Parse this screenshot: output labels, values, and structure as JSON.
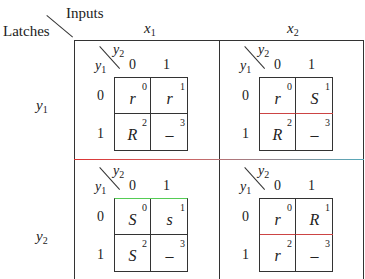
{
  "header": {
    "inputs_label": "Inputs",
    "latches_label": "Latches",
    "columns": [
      {
        "var": "x",
        "sub": "1"
      },
      {
        "var": "x",
        "sub": "2"
      }
    ],
    "rows": [
      {
        "var": "y",
        "sub": "1"
      },
      {
        "var": "y",
        "sub": "2"
      }
    ]
  },
  "kmap_labels": {
    "col_var": "y",
    "col_sub": "2",
    "row_var": "y",
    "row_sub": "1",
    "col_values": [
      "0",
      "1"
    ],
    "row_values": [
      "0",
      "1"
    ]
  },
  "maps": [
    {
      "id": "y1-x1",
      "cells": [
        {
          "v": "r",
          "n": "0"
        },
        {
          "v": "r",
          "n": "1"
        },
        {
          "v": "R",
          "n": "2"
        },
        {
          "v": "–",
          "n": "3"
        }
      ]
    },
    {
      "id": "y1-x2",
      "cells": [
        {
          "v": "r",
          "n": "0"
        },
        {
          "v": "S",
          "n": "1"
        },
        {
          "v": "R",
          "n": "2"
        },
        {
          "v": "–",
          "n": "3"
        }
      ]
    },
    {
      "id": "y2-x1",
      "cells": [
        {
          "v": "S",
          "n": "0"
        },
        {
          "v": "s",
          "n": "1"
        },
        {
          "v": "S",
          "n": "2"
        },
        {
          "v": "–",
          "n": "3"
        }
      ]
    },
    {
      "id": "y2-x2",
      "cells": [
        {
          "v": "r",
          "n": "0"
        },
        {
          "v": "R",
          "n": "1"
        },
        {
          "v": "r",
          "n": "2"
        },
        {
          "v": "–",
          "n": "3"
        }
      ]
    }
  ]
}
